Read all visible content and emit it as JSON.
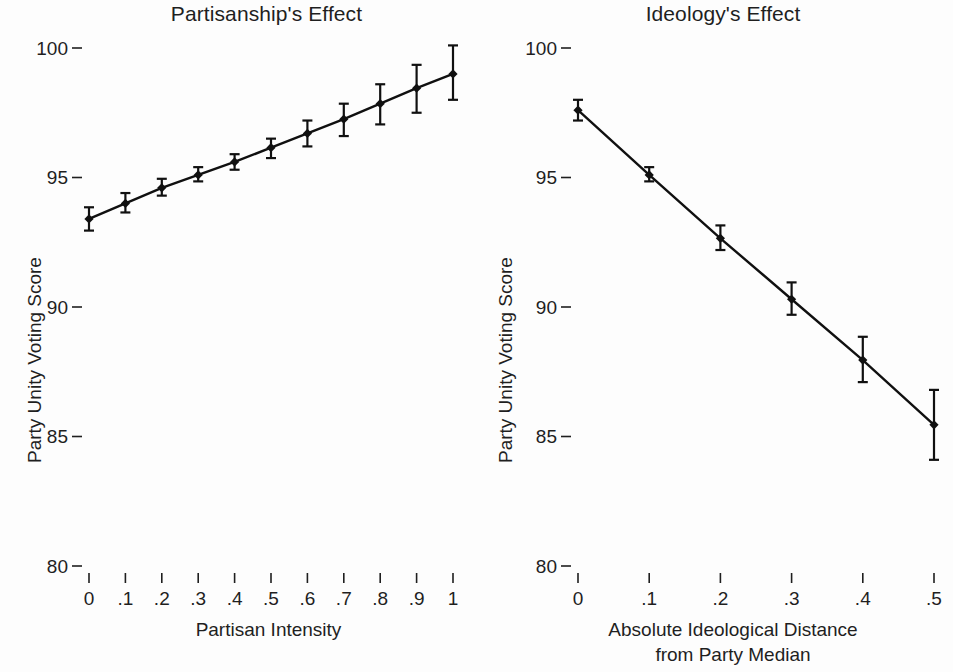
{
  "figure": {
    "background": "#fdfdfd",
    "ink_color": "#101010"
  },
  "panels": {
    "left": {
      "title": "Partisanship's Effect",
      "ylabel": "Party Unity Voting Score",
      "xlabel": "Partisan Intensity",
      "y_ticks": [
        "100",
        "95",
        "90",
        "85",
        "80"
      ],
      "x_ticks": [
        "0",
        ".1",
        ".2",
        ".3",
        ".4",
        ".5",
        ".6",
        ".7",
        ".8",
        ".9",
        "1"
      ]
    },
    "right": {
      "title": "Ideology's Effect",
      "ylabel": "Party Unity Voting Score",
      "xlabel_line1": "Absolute Ideological Distance",
      "xlabel_line2": "from Party Median",
      "y_ticks": [
        "100",
        "95",
        "90",
        "85",
        "80"
      ],
      "x_ticks": [
        "0",
        ".1",
        ".2",
        ".3",
        ".4",
        ".5"
      ]
    }
  },
  "chart_data": [
    {
      "type": "line",
      "title": "Partisanship's Effect",
      "xlabel": "Partisan Intensity",
      "ylabel": "Party Unity Voting Score",
      "xlim": [
        0,
        1
      ],
      "ylim": [
        80,
        100
      ],
      "xticks": [
        0,
        0.1,
        0.2,
        0.3,
        0.4,
        0.5,
        0.6,
        0.7,
        0.8,
        0.9,
        1
      ],
      "xticklabels": [
        "0",
        ".1",
        ".2",
        ".3",
        ".4",
        ".5",
        ".6",
        ".7",
        ".8",
        ".9",
        "1"
      ],
      "yticks": [
        80,
        85,
        90,
        95,
        100
      ],
      "yticklabels": [
        "80",
        "85",
        "90",
        "95",
        "100"
      ],
      "grid": false,
      "legend": null,
      "error_bars": true,
      "x": [
        0,
        0.1,
        0.2,
        0.3,
        0.4,
        0.5,
        0.6,
        0.7,
        0.8,
        0.9,
        1
      ],
      "values": [
        93.4,
        94.0,
        94.6,
        95.1,
        95.6,
        96.15,
        96.7,
        97.25,
        97.85,
        98.45,
        99.0
      ],
      "err_low": [
        92.95,
        93.65,
        94.3,
        94.85,
        95.3,
        95.75,
        96.2,
        96.6,
        97.05,
        97.5,
        98.0
      ],
      "err_high": [
        93.85,
        94.4,
        94.95,
        95.4,
        95.9,
        96.5,
        97.2,
        97.85,
        98.6,
        99.35,
        100.1
      ],
      "marker": "diamond"
    },
    {
      "type": "line",
      "title": "Ideology's Effect",
      "xlabel": "Absolute Ideological Distance from Party Median",
      "ylabel": "Party Unity Voting Score",
      "xlim": [
        0,
        0.5
      ],
      "ylim": [
        80,
        100
      ],
      "xticks": [
        0,
        0.1,
        0.2,
        0.3,
        0.4,
        0.5
      ],
      "xticklabels": [
        "0",
        ".1",
        ".2",
        ".3",
        ".4",
        ".5"
      ],
      "yticks": [
        80,
        85,
        90,
        95,
        100
      ],
      "yticklabels": [
        "80",
        "85",
        "90",
        "95",
        "100"
      ],
      "grid": false,
      "legend": null,
      "error_bars": true,
      "x": [
        0,
        0.1,
        0.2,
        0.3,
        0.4,
        0.5
      ],
      "values": [
        97.6,
        95.1,
        92.65,
        90.3,
        87.95,
        85.45
      ],
      "err_low": [
        97.2,
        94.85,
        92.2,
        89.7,
        87.1,
        84.1
      ],
      "err_high": [
        98.0,
        95.4,
        93.15,
        90.95,
        88.85,
        86.8
      ],
      "marker": "diamond"
    }
  ]
}
